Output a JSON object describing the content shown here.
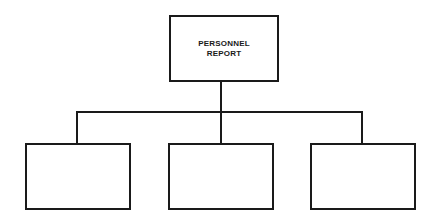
{
  "diagram": {
    "type": "org-chart",
    "root": {
      "label_line1": "PERSONNEL",
      "label_line2": "REPORT"
    },
    "children": [
      {
        "label": ""
      },
      {
        "label": ""
      },
      {
        "label": ""
      }
    ],
    "colors": {
      "stroke": "#1a1a1a",
      "background": "#ffffff"
    }
  }
}
